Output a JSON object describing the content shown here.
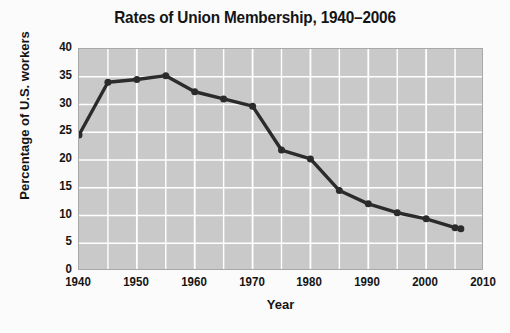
{
  "chart_data": {
    "type": "line",
    "title": "Rates of Union Membership, 1940–2006",
    "xlabel": "Year",
    "ylabel": "Percentage of U.S. workers",
    "xlim": [
      1940,
      2010
    ],
    "ylim": [
      0,
      40
    ],
    "xticks": [
      1940,
      1950,
      1960,
      1970,
      1980,
      1990,
      2000,
      2010
    ],
    "yticks": [
      0,
      5,
      10,
      15,
      20,
      25,
      30,
      35,
      40
    ],
    "grid": true,
    "grid_color": "#ffffff",
    "plot_background": "#c9c9c9",
    "legend": "none",
    "line_color": "#2b2b2b",
    "marker": "circle",
    "x": [
      1940,
      1945,
      1950,
      1955,
      1960,
      1965,
      1970,
      1975,
      1980,
      1985,
      1990,
      1995,
      2000,
      2005,
      2006
    ],
    "values": [
      24.5,
      34.0,
      34.5,
      35.2,
      32.3,
      31.0,
      29.7,
      21.8,
      20.2,
      14.5,
      12.1,
      10.5,
      9.4,
      7.8,
      7.6
    ],
    "series": [
      {
        "name": "Union membership rate",
        "values": [
          24.5,
          34.0,
          34.5,
          35.2,
          32.3,
          31.0,
          29.7,
          21.8,
          20.2,
          14.5,
          12.1,
          10.5,
          9.4,
          7.8,
          7.6
        ]
      }
    ]
  }
}
